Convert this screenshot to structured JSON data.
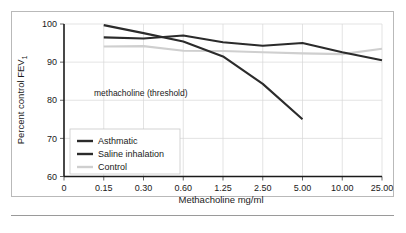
{
  "figure": {
    "annotation": "methacholine (threshold)",
    "y_axis_title_main": "Percent control FEV",
    "y_axis_title_sub": "1",
    "x_axis_title": "Methacholine mg/ml"
  },
  "legend": {
    "position": "inner-lower-left",
    "items": [
      {
        "label": "Asthmatic",
        "color": "#2b2b2b"
      },
      {
        "label": "Saline inhalation",
        "color": "#2b2b2b"
      },
      {
        "label": "Control",
        "color": "#cfcfcf"
      }
    ]
  },
  "chart_data": {
    "type": "line",
    "title": "",
    "subtitle": "",
    "xlabel": "Methacholine mg/ml",
    "ylabel": "Percent control FEV1",
    "grid": true,
    "legend_position": "inner-lower-left",
    "x_scale": "categorical-log",
    "categories": [
      "0",
      "0.15",
      "0.30",
      "0.60",
      "1.25",
      "2.50",
      "5.00",
      "10.00",
      "25.00"
    ],
    "ylim": [
      60,
      100
    ],
    "yticks": [
      60,
      70,
      80,
      90,
      100
    ],
    "annotations": [
      {
        "text": "methacholine (threshold)",
        "x": "0.30",
        "y": 80.5
      }
    ],
    "series": [
      {
        "name": "Asthmatic",
        "color": "#2b2b2b",
        "linewidth": 2.1,
        "x": [
          "0.15",
          "0.30",
          "0.60",
          "1.25",
          "2.50",
          "5.00",
          "10.00",
          "25.00"
        ],
        "values": [
          96.5,
          96.2,
          97.0,
          95.2,
          94.3,
          95.0,
          92.6,
          90.5
        ]
      },
      {
        "name": "Saline inhalation",
        "color": "#2b2b2b",
        "linewidth": 2.1,
        "x": [
          "0.15",
          "0.30",
          "0.60",
          "1.25",
          "2.50",
          "5.00"
        ],
        "values": [
          99.7,
          97.6,
          95.4,
          91.5,
          84.3,
          75.0
        ]
      },
      {
        "name": "Control",
        "color": "#cfcfcf",
        "linewidth": 2.1,
        "x": [
          "0.15",
          "0.30",
          "0.60",
          "1.25",
          "2.50",
          "5.00",
          "10.00",
          "25.00"
        ],
        "values": [
          94.1,
          94.2,
          93.0,
          92.9,
          92.6,
          92.3,
          92.1,
          93.5
        ]
      }
    ]
  }
}
